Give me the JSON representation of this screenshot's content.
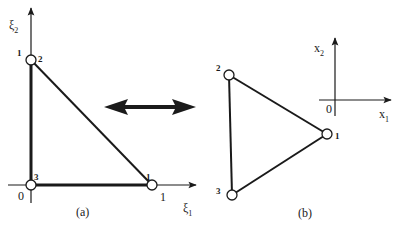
{
  "panel_a": {
    "caption": "(a)",
    "axis_vertical_label": "ξ",
    "axis_vertical_sub": "2",
    "axis_horizontal_label": "ξ",
    "axis_horizontal_sub": "1",
    "origin_label": "0",
    "tick_vertical": "1",
    "tick_horizontal": "1",
    "nodes": [
      {
        "id": "1",
        "label": "1"
      },
      {
        "id": "2",
        "label": "2"
      },
      {
        "id": "3",
        "label": "3"
      }
    ]
  },
  "panel_b": {
    "caption": "(b)",
    "axis_vertical_label": "x",
    "axis_vertical_sub": "2",
    "axis_horizontal_label": "x",
    "axis_horizontal_sub": "1",
    "origin_label": "0",
    "nodes": [
      {
        "id": "1",
        "label": "1"
      },
      {
        "id": "2",
        "label": "2"
      },
      {
        "id": "3",
        "label": "3"
      }
    ]
  },
  "connector": {
    "icon": "double-arrow-icon"
  },
  "colors": {
    "stroke": "#1a1a1a",
    "node_fill": "#ffffff",
    "background": "#ffffff"
  }
}
